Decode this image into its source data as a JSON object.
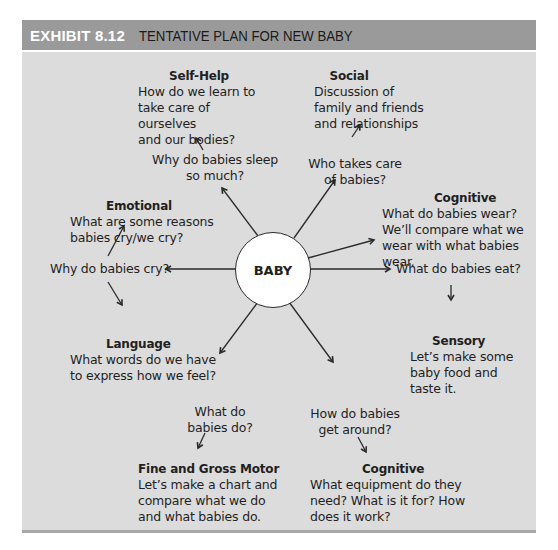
{
  "header": {
    "exhibit_label": "EXHIBIT 8.12",
    "title": "TENTATIVE PLAN FOR NEW BABY"
  },
  "center": {
    "label": "BABY"
  },
  "nodes": {
    "self_help": {
      "heading": "Self-Help",
      "lines": [
        "How do we learn to",
        "take care of ourselves",
        "and our bodies?"
      ]
    },
    "sleep_question": {
      "lines": [
        "Why do babies sleep",
        "so much?"
      ]
    },
    "social": {
      "heading": "Social",
      "lines": [
        "Discussion of",
        "family and friends",
        "and relationships"
      ]
    },
    "care_question": {
      "lines": [
        "Who takes care",
        "of babies?"
      ]
    },
    "emotional": {
      "heading": "Emotional",
      "lines": [
        "What are some reasons",
        "babies cry/we cry?"
      ]
    },
    "cry_question": {
      "lines": [
        "Why do babies cry?"
      ]
    },
    "cognitive_wear": {
      "heading": "Cognitive",
      "lines": [
        "What do babies wear?",
        "We’ll compare what we",
        "wear with what babies",
        "wear."
      ]
    },
    "eat_question": {
      "lines": [
        "What do babies eat?"
      ]
    },
    "sensory": {
      "heading": "Sensory",
      "lines": [
        "Let’s make some",
        "baby food and",
        "taste it."
      ]
    },
    "language": {
      "heading": "Language",
      "lines": [
        "What words do we have",
        "to express how we feel?"
      ]
    },
    "do_question": {
      "lines": [
        "What do",
        "babies do?"
      ]
    },
    "motor": {
      "heading": "Fine and Gross Motor",
      "lines": [
        "Let’s make a chart and",
        "compare what we do",
        "and what babies do."
      ]
    },
    "around_question": {
      "lines": [
        "How do babies",
        "get around?"
      ]
    },
    "cognitive_equipment": {
      "heading": "Cognitive",
      "lines": [
        "What equipment do they",
        "need? What is it for? How",
        "does it work?"
      ]
    }
  },
  "colors": {
    "header_bg": "#9a9a9a",
    "panel_bg": "#dcdcdc",
    "exhibit_text": "#ffffff",
    "line": "#2a2a2a"
  }
}
